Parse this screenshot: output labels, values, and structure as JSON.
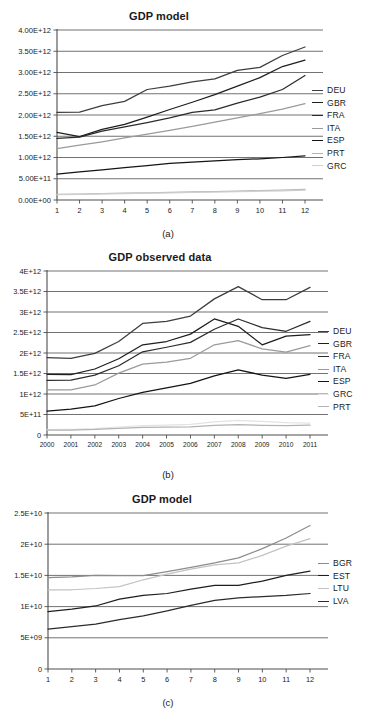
{
  "page": {
    "background": "#ffffff",
    "panel_count": 3
  },
  "palette": {
    "deu": "#3d3d3d",
    "gbr": "#1e1e1e",
    "fra": "#2b2b2b",
    "ita": "#9a9a9a",
    "esp": "#141414",
    "prt": "#b3b3b3",
    "grc": "#cfcfcf",
    "bgr": "#8c8c8c",
    "est": "#1e1e1e",
    "ltu": "#c2c2c2",
    "lva": "#2b2b2b",
    "axis": "#4d4d4d",
    "grid": "#595959",
    "text": "#1a1a1a"
  },
  "figures": [
    {
      "id": "a",
      "caption": "(a)",
      "title": "GDP model",
      "legend_position": "right"
    },
    {
      "id": "b",
      "caption": "(b)",
      "title": "GDP observed data",
      "legend_position": "right"
    },
    {
      "id": "c",
      "caption": "(c)",
      "title": "GDP model",
      "legend_position": "right"
    }
  ],
  "chart_data": [
    {
      "type": "line",
      "panel": "a",
      "title": "GDP model",
      "xlabel": "",
      "ylabel": "",
      "grid": true,
      "legend": [
        "DEU",
        "GBR",
        "FRA",
        "ITA",
        "ESP",
        "PRT",
        "GRC"
      ],
      "legend_position": "right",
      "x": [
        1,
        2,
        3,
        4,
        5,
        6,
        7,
        8,
        9,
        10,
        11,
        12
      ],
      "xticklabels": [
        "1",
        "2",
        "3",
        "4",
        "5",
        "6",
        "7",
        "8",
        "9",
        "10",
        "11",
        "12"
      ],
      "ylim": [
        0,
        4000000000000.0
      ],
      "yticks": [
        0,
        500000000000.0,
        1000000000000.0,
        1500000000000.0,
        2000000000000.0,
        2500000000000.0,
        3000000000000.0,
        3500000000000.0,
        4000000000000.0
      ],
      "yticklabels": [
        "0.00E+00",
        "5.00E+11",
        "1.00E+12",
        "1.50E+12",
        "2.00E+12",
        "2.50E+12",
        "3.00E+12",
        "3.50E+12",
        "4.00E+12"
      ],
      "series": [
        {
          "name": "DEU",
          "color": "#3d3d3d",
          "values": [
            2060000000000.0,
            2070000000000.0,
            2220000000000.0,
            2320000000000.0,
            2600000000000.0,
            2680000000000.0,
            2780000000000.0,
            2850000000000.0,
            3050000000000.0,
            3120000000000.0,
            3400000000000.0,
            3600000000000.0
          ]
        },
        {
          "name": "GBR",
          "color": "#1e1e1e",
          "values": [
            1590000000000.0,
            1490000000000.0,
            1660000000000.0,
            1780000000000.0,
            1950000000000.0,
            2130000000000.0,
            2300000000000.0,
            2480000000000.0,
            2680000000000.0,
            2880000000000.0,
            3140000000000.0,
            3290000000000.0
          ]
        },
        {
          "name": "FRA",
          "color": "#2b2b2b",
          "values": [
            1450000000000.0,
            1480000000000.0,
            1620000000000.0,
            1720000000000.0,
            1820000000000.0,
            1930000000000.0,
            2060000000000.0,
            2120000000000.0,
            2280000000000.0,
            2420000000000.0,
            2600000000000.0,
            2930000000000.0
          ]
        },
        {
          "name": "ITA",
          "color": "#9a9a9a",
          "values": [
            1210000000000.0,
            1290000000000.0,
            1370000000000.0,
            1460000000000.0,
            1550000000000.0,
            1640000000000.0,
            1730000000000.0,
            1830000000000.0,
            1930000000000.0,
            2030000000000.0,
            2140000000000.0,
            2270000000000.0
          ]
        },
        {
          "name": "ESP",
          "color": "#141414",
          "values": [
            610000000000.0,
            660000000000.0,
            710000000000.0,
            760000000000.0,
            810000000000.0,
            860000000000.0,
            890000000000.0,
            920000000000.0,
            950000000000.0,
            970000000000.0,
            1000000000000.0,
            1040000000000.0
          ]
        },
        {
          "name": "PRT",
          "color": "#b3b3b3",
          "values": [
            130000000000.0,
            140000000000.0,
            150000000000.0,
            160000000000.0,
            170000000000.0,
            180000000000.0,
            190000000000.0,
            200000000000.0,
            210000000000.0,
            220000000000.0,
            230000000000.0,
            250000000000.0
          ]
        },
        {
          "name": "GRC",
          "color": "#cfcfcf",
          "values": [
            125000000000.0,
            133000000000.0,
            142000000000.0,
            151000000000.0,
            160000000000.0,
            169000000000.0,
            178000000000.0,
            188000000000.0,
            197000000000.0,
            207000000000.0,
            217000000000.0,
            230000000000.0
          ]
        }
      ]
    },
    {
      "type": "line",
      "panel": "b",
      "title": "GDP observed data",
      "xlabel": "",
      "ylabel": "",
      "grid": true,
      "legend": [
        "DEU",
        "GBR",
        "FRA",
        "ITA",
        "ESP",
        "GRC",
        "PRT"
      ],
      "legend_position": "right",
      "x": [
        2000,
        2001,
        2002,
        2003,
        2004,
        2005,
        2006,
        2007,
        2008,
        2009,
        2010,
        2011
      ],
      "xticklabels": [
        "2000",
        "2001",
        "2002",
        "2003",
        "2004",
        "2005",
        "2006",
        "2007",
        "2008",
        "2009",
        "2010",
        "2011"
      ],
      "ylim": [
        0,
        4000000000000.0
      ],
      "yticks": [
        0,
        500000000000.0,
        1000000000000.0,
        1500000000000.0,
        2000000000000.0,
        2500000000000.0,
        3000000000000.0,
        3500000000000.0,
        4000000000000.0
      ],
      "yticklabels": [
        "0",
        "5E+11",
        "1E+12",
        "1.5E+12",
        "2E+12",
        "2.5E+12",
        "3E+12",
        "3.5E+12",
        "4E+12"
      ],
      "series": [
        {
          "name": "DEU",
          "color": "#3d3d3d",
          "values": [
            1890000000000.0,
            1870000000000.0,
            1990000000000.0,
            2280000000000.0,
            2720000000000.0,
            2770000000000.0,
            2900000000000.0,
            3320000000000.0,
            3620000000000.0,
            3300000000000.0,
            3300000000000.0,
            3600000000000.0
          ]
        },
        {
          "name": "GBR",
          "color": "#1e1e1e",
          "values": [
            1480000000000.0,
            1470000000000.0,
            1610000000000.0,
            1860000000000.0,
            2200000000000.0,
            2280000000000.0,
            2460000000000.0,
            2830000000000.0,
            2650000000000.0,
            2200000000000.0,
            2410000000000.0,
            2450000000000.0
          ]
        },
        {
          "name": "FRA",
          "color": "#2b2b2b",
          "values": [
            1330000000000.0,
            1340000000000.0,
            1460000000000.0,
            1690000000000.0,
            2030000000000.0,
            2140000000000.0,
            2260000000000.0,
            2580000000000.0,
            2830000000000.0,
            2620000000000.0,
            2530000000000.0,
            2770000000000.0
          ]
        },
        {
          "name": "ITA",
          "color": "#9a9a9a",
          "values": [
            1100000000000.0,
            1100000000000.0,
            1220000000000.0,
            1510000000000.0,
            1730000000000.0,
            1780000000000.0,
            1870000000000.0,
            2200000000000.0,
            2300000000000.0,
            2100000000000.0,
            2020000000000.0,
            2180000000000.0
          ]
        },
        {
          "name": "ESP",
          "color": "#141414",
          "values": [
            580000000000.0,
            630000000000.0,
            710000000000.0,
            890000000000.0,
            1040000000000.0,
            1150000000000.0,
            1260000000000.0,
            1440000000000.0,
            1590000000000.0,
            1460000000000.0,
            1380000000000.0,
            1480000000000.0
          ]
        },
        {
          "name": "GRC",
          "color": "#e3e3e3",
          "values": [
            130000000000.0,
            137000000000.0,
            153000000000.0,
            195000000000.0,
            228000000000.0,
            240000000000.0,
            262000000000.0,
            318000000000.0,
            354000000000.0,
            330000000000.0,
            299000000000.0,
            290000000000.0
          ]
        },
        {
          "name": "PRT",
          "color": "#b3b3b3",
          "values": [
            118000000000.0,
            121000000000.0,
            135000000000.0,
            162000000000.0,
            185000000000.0,
            192000000000.0,
            201000000000.0,
            232000000000.0,
            252000000000.0,
            235000000000.0,
            229000000000.0,
            238000000000.0
          ]
        }
      ]
    },
    {
      "type": "line",
      "panel": "c",
      "title": "GDP model",
      "xlabel": "",
      "ylabel": "",
      "grid": true,
      "legend": [
        "BGR",
        "EST",
        "LTU",
        "LVA"
      ],
      "legend_position": "right",
      "x": [
        1,
        2,
        3,
        4,
        5,
        6,
        7,
        8,
        9,
        10,
        11,
        12
      ],
      "xticklabels": [
        "1",
        "2",
        "3",
        "4",
        "5",
        "6",
        "7",
        "8",
        "9",
        "10",
        "11",
        "12"
      ],
      "ylim": [
        0,
        25000000000.0
      ],
      "yticks": [
        0,
        5000000000.0,
        10000000000.0,
        15000000000.0,
        20000000000.0,
        25000000000.0
      ],
      "yticklabels": [
        "0",
        "5E+09",
        "1E+10",
        "1.5E+10",
        "2E+10",
        "2.5E+10"
      ],
      "series": [
        {
          "name": "BGR",
          "color": "#8c8c8c",
          "values": [
            14650000000.0,
            14750000000.0,
            15000000000.0,
            14950000000.0,
            14950000000.0,
            15600000000.0,
            16300000000.0,
            17000000000.0,
            17800000000.0,
            19300000000.0,
            21000000000.0,
            23000000000.0
          ]
        },
        {
          "name": "EST",
          "color": "#1e1e1e",
          "values": [
            9200000000.0,
            9600000000.0,
            10100000000.0,
            11200000000.0,
            11800000000.0,
            12100000000.0,
            12800000000.0,
            13400000000.0,
            13400000000.0,
            14100000000.0,
            15000000000.0,
            15700000000.0
          ]
        },
        {
          "name": "LTU",
          "color": "#c2c2c2",
          "values": [
            12700000000.0,
            12700000000.0,
            12900000000.0,
            13200000000.0,
            14300000000.0,
            15200000000.0,
            16000000000.0,
            16700000000.0,
            17000000000.0,
            18200000000.0,
            19700000000.0,
            20900000000.0
          ]
        },
        {
          "name": "LVA",
          "color": "#2b2b2b",
          "values": [
            6400000000.0,
            6800000000.0,
            7200000000.0,
            7900000000.0,
            8500000000.0,
            9300000000.0,
            10200000000.0,
            11000000000.0,
            11400000000.0,
            11600000000.0,
            11800000000.0,
            12100000000.0
          ]
        }
      ]
    }
  ]
}
